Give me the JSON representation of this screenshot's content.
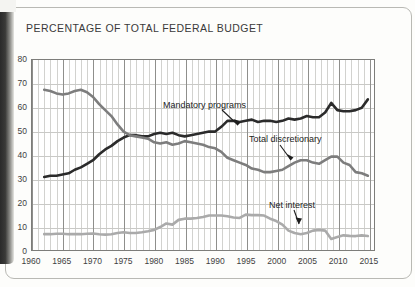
{
  "page": {
    "title": "PERCENTAGE OF TOTAL FEDERAL BUDGET"
  },
  "chart_data": {
    "type": "line",
    "title": "PERCENTAGE OF TOTAL FEDERAL BUDGET",
    "xlabel": "",
    "ylabel": "",
    "xlim": [
      1960,
      2016
    ],
    "ylim": [
      0,
      80
    ],
    "yticks": [
      0,
      10,
      20,
      30,
      40,
      50,
      60,
      70,
      80
    ],
    "xticks": [
      1960,
      1965,
      1970,
      1975,
      1980,
      1985,
      1990,
      1995,
      2000,
      2005,
      2010,
      2015
    ],
    "grid": true,
    "grid_minor_x": "annual",
    "legend": "inline-annotations",
    "colors": {
      "mandatory": "#2b2b2b",
      "discretionary": "#7d7d7d",
      "net_interest": "#aaaaaa",
      "axis": "#7d7d7a",
      "grid_minor": "#d2d2cf",
      "grid_major": "#8f8f8c"
    },
    "annotations": [
      {
        "text": "Mandatory programs",
        "series": "mandatory"
      },
      {
        "text": "Total discretionary",
        "series": "discretionary"
      },
      {
        "text": "Net interest",
        "series": "net_interest"
      }
    ],
    "x": [
      1962,
      1963,
      1964,
      1965,
      1966,
      1967,
      1968,
      1969,
      1970,
      1971,
      1972,
      1973,
      1974,
      1975,
      1976,
      1977,
      1978,
      1979,
      1980,
      1981,
      1982,
      1983,
      1984,
      1985,
      1986,
      1987,
      1988,
      1989,
      1990,
      1991,
      1992,
      1993,
      1994,
      1995,
      1996,
      1997,
      1998,
      1999,
      2000,
      2001,
      2002,
      2003,
      2004,
      2005,
      2006,
      2007,
      2008,
      2009,
      2010,
      2011,
      2012,
      2013,
      2014,
      2015
    ],
    "series": [
      {
        "name": "Mandatory programs",
        "key": "mandatory",
        "color": "#2b2b2b",
        "values": [
          31,
          31.5,
          31.5,
          32,
          32.5,
          34,
          35,
          36.5,
          38,
          40.5,
          42.5,
          44,
          46,
          47.5,
          48.5,
          48.5,
          48,
          48,
          49,
          49.5,
          49,
          49.5,
          48.5,
          48,
          48.5,
          49,
          49.5,
          50,
          50,
          52,
          54.5,
          54.5,
          54,
          54.5,
          55,
          54,
          54.5,
          54.5,
          54,
          54.5,
          55.5,
          55,
          55.5,
          56.5,
          56,
          56,
          58,
          62,
          59,
          58.5,
          58.5,
          59,
          60,
          63.5
        ]
      },
      {
        "name": "Total discretionary",
        "key": "discretionary",
        "color": "#7d7d7d",
        "values": [
          67.5,
          67,
          66,
          65.5,
          66,
          67,
          67.5,
          66.5,
          64.5,
          61.5,
          59,
          56.5,
          53,
          50,
          48.5,
          48,
          47.5,
          47,
          45.5,
          45,
          45.5,
          44.5,
          45,
          46,
          45.5,
          45,
          44.5,
          43.5,
          43,
          41.5,
          39,
          38,
          37,
          36,
          34.5,
          34,
          33,
          33,
          33.5,
          34,
          35.5,
          37,
          38,
          38,
          37,
          36.5,
          38,
          39.5,
          39.5,
          37,
          36,
          33,
          32.5,
          31.5
        ]
      },
      {
        "name": "Net interest",
        "key": "net_interest",
        "color": "#aaaaaa",
        "values": [
          7,
          7,
          7.2,
          7.2,
          7,
          7,
          7,
          7.2,
          7.3,
          7,
          6.8,
          7,
          7.5,
          7.8,
          7.5,
          7.5,
          7.8,
          8.2,
          8.8,
          10,
          11.5,
          11,
          13,
          13.5,
          13.5,
          13.8,
          14.2,
          14.8,
          14.8,
          14.8,
          14.5,
          14,
          13.8,
          15.2,
          15,
          15,
          14.8,
          13.5,
          12.5,
          11,
          8.5,
          7.5,
          7,
          7.5,
          8.5,
          8.8,
          8.5,
          5,
          5.8,
          6.5,
          6.3,
          6.2,
          6.5,
          6.2
        ]
      }
    ]
  }
}
